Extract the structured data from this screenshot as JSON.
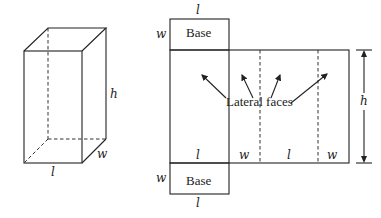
{
  "prism": {
    "label_length": "l",
    "label_width": "w",
    "label_height": "h"
  },
  "net": {
    "top_base": {
      "label": "Base",
      "side_top": "l",
      "side_left": "w"
    },
    "bottom_base": {
      "label": "Base",
      "side_bottom": "l",
      "side_left": "w"
    },
    "lateral_label": "Lateral faces",
    "bottom_labels": [
      "l",
      "w",
      "l",
      "w"
    ],
    "height_label": "h"
  }
}
